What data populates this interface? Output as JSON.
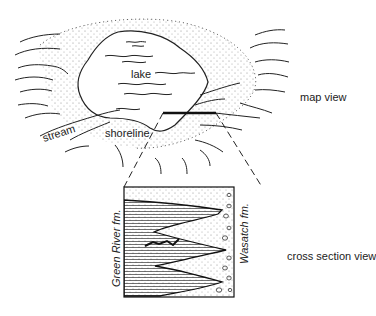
{
  "diagram": {
    "map_view": {
      "caption": "map view",
      "labels": {
        "lake": "lake",
        "stream": "stream",
        "shoreline": "shoreline"
      }
    },
    "cross_section_view": {
      "caption": "cross section view",
      "formations": {
        "left": "Green River fm.",
        "right": "Wasatch fm."
      }
    },
    "colors": {
      "ink": "#222222",
      "background": "#ffffff"
    }
  }
}
